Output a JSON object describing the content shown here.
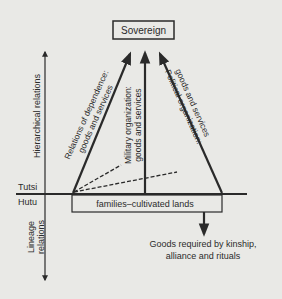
{
  "diagram": {
    "top_box": "Sovereign",
    "base_box": "families–cultivated lands",
    "upper_label": "Tutsi",
    "lower_label": "Hutu",
    "axis_up_label": "Hierarchical relations",
    "axis_down_label_line1": "Lineage",
    "axis_down_label_line2": "relations",
    "arrow_left_line1": "Relations of dependence:",
    "arrow_left_line2": "goods and services",
    "arrow_middle_line1": "Military organization:",
    "arrow_middle_line2": "goods and services",
    "arrow_right_line1": "Political organization:",
    "arrow_right_line2": "goods and services",
    "outflow_line1": "Goods required by kinship,",
    "outflow_line2": "alliance and rituals",
    "colors": {
      "background": "#e9e9e6",
      "ink": "#2a2a2a"
    }
  }
}
